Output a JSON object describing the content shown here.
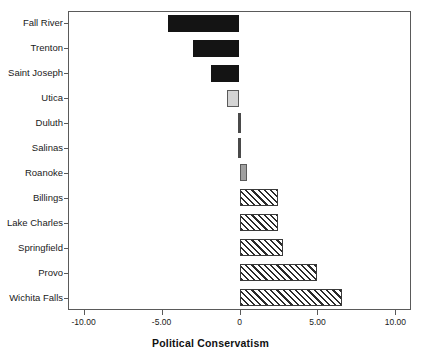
{
  "chart_data": {
    "type": "bar",
    "orientation": "horizontal",
    "title": "",
    "xlabel": "Political Conservatism",
    "ylabel": "",
    "xlim": [
      -11.0,
      11.0
    ],
    "xticks": [
      -10,
      -5,
      0,
      5,
      10
    ],
    "xtick_labels": [
      "-10.00",
      "-5.00",
      "0",
      "5.00",
      "10.00"
    ],
    "grid": false,
    "legend": false,
    "categories": [
      "Fall River",
      "Trenton",
      "Saint Joseph",
      "Utica",
      "Duluth",
      "Salinas",
      "Roanoke",
      "Billings",
      "Lake Charles",
      "Springfield",
      "Provo",
      "Wichita Falls"
    ],
    "values": [
      -4.6,
      -3.0,
      -1.8,
      -0.8,
      -0.05,
      0.05,
      0.5,
      2.5,
      2.5,
      2.8,
      5.0,
      6.6
    ],
    "bar_styles": [
      "solid-black",
      "solid-black",
      "solid-black",
      "light-gray",
      "zero-sliver",
      "zero-sliver",
      "mid-gray",
      "hatched",
      "hatched",
      "hatched",
      "hatched",
      "hatched"
    ],
    "colors": {
      "solid_black": "#141414",
      "light_gray": "#d4d4d4",
      "mid_gray": "#a0a0a0",
      "hatch_line": "#2b2b2b",
      "hatch_background": "#ffffff",
      "axis": "#5a5a5a",
      "text": "#1a1a1a",
      "plot_background": "#ffffff"
    }
  }
}
